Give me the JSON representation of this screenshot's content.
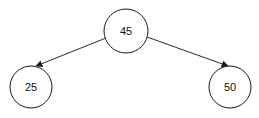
{
  "diagram": {
    "type": "binary-tree",
    "nodes": [
      {
        "id": "root",
        "label": "45",
        "cx": 126,
        "cy": 31,
        "r": 22
      },
      {
        "id": "left",
        "label": "25",
        "cx": 31,
        "cy": 87,
        "r": 21
      },
      {
        "id": "right",
        "label": "50",
        "cx": 230,
        "cy": 87,
        "r": 21
      }
    ],
    "edges": [
      {
        "from": "45",
        "to": "25"
      },
      {
        "from": "45",
        "to": "50"
      }
    ],
    "colors": {
      "stroke": "#1a1a1a",
      "fill": "#ffffff",
      "text": "#111111"
    }
  }
}
